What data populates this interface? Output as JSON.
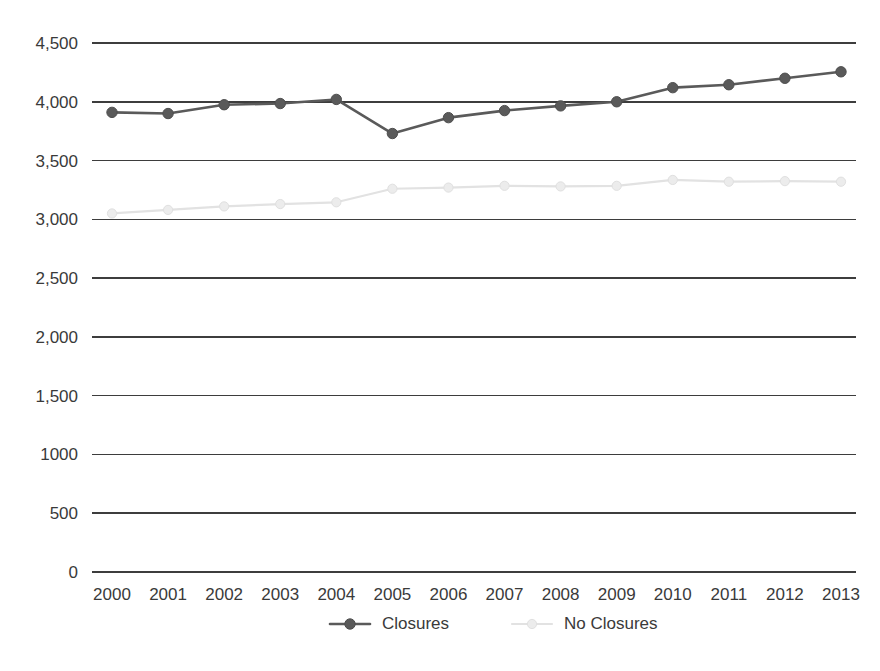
{
  "chart_data": {
    "type": "line",
    "title": "",
    "subtitle": "",
    "xlabel": "",
    "ylabel": "",
    "categories": [
      "2000",
      "2001",
      "2002",
      "2003",
      "2004",
      "2005",
      "2006",
      "2007",
      "2008",
      "2009",
      "2010",
      "2011",
      "2012",
      "2013"
    ],
    "x_tick_labels": [
      "2000",
      "2001",
      "2002",
      "2003",
      "2004",
      "2005",
      "2006",
      "2007",
      "2008",
      "2009",
      "2010",
      "2011",
      "2012",
      "2013"
    ],
    "y_tick_labels": [
      "4,500",
      "4,000",
      "3,500",
      "3,000",
      "2,500",
      "2,000",
      "1,500",
      "1000",
      "500",
      "0"
    ],
    "y_tick_values": [
      4500,
      4000,
      3500,
      3000,
      2500,
      2000,
      1500,
      1000,
      500,
      0
    ],
    "ylim": [
      0,
      4500
    ],
    "grid": true,
    "grid_axis": "y",
    "legend_position": "bottom",
    "series": [
      {
        "name": "Closures",
        "color": "#5a5a5a",
        "marker": "circle",
        "values": [
          3910,
          3900,
          3975,
          3985,
          4020,
          3730,
          3865,
          3925,
          3965,
          4000,
          4120,
          4145,
          4200,
          4255
        ]
      },
      {
        "name": "No Closures",
        "color": "#e2e2e2",
        "marker": "circle",
        "values": [
          3050,
          3080,
          3110,
          3130,
          3145,
          3260,
          3270,
          3285,
          3280,
          3285,
          3335,
          3320,
          3325,
          3320
        ]
      }
    ],
    "legend": [
      {
        "label": "Closures",
        "color": "#5a5a5a"
      },
      {
        "label": "No Closures",
        "color": "#e2e2e2"
      }
    ]
  },
  "colors": {
    "background": "#ffffff",
    "gridline": "#3d3d3d",
    "text": "#3a3a3a",
    "series_closures": "#5a5a5a",
    "series_no_closures": "#e2e2e2"
  }
}
